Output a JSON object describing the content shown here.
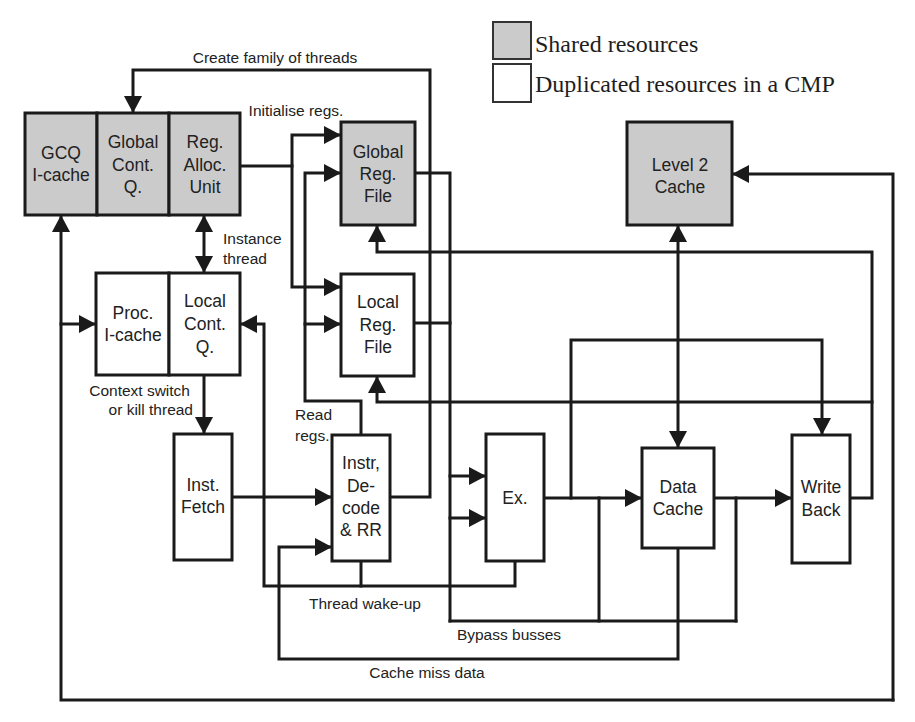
{
  "colors": {
    "shared_fill": "#cbcbcb",
    "duplicated_fill": "#ffffff",
    "stroke": "#1a1a1a"
  },
  "legend": {
    "shared": "Shared resources",
    "duplicated": "Duplicated resources in a CMP"
  },
  "blocks": {
    "gcq_icache": {
      "shared": true,
      "lines": [
        "GCQ",
        "I-cache"
      ]
    },
    "global_cont_q": {
      "shared": true,
      "lines": [
        "Global",
        "Cont.",
        "Q."
      ]
    },
    "reg_alloc_unit": {
      "shared": true,
      "lines": [
        "Reg.",
        "Alloc.",
        "Unit"
      ]
    },
    "global_reg_file": {
      "shared": true,
      "lines": [
        "Global",
        "Reg.",
        "File"
      ]
    },
    "level2_cache": {
      "shared": true,
      "lines": [
        "Level 2",
        "Cache"
      ]
    },
    "proc_icache": {
      "shared": false,
      "lines": [
        "Proc.",
        "I-cache"
      ]
    },
    "local_cont_q": {
      "shared": false,
      "lines": [
        "Local",
        "Cont.",
        "Q."
      ]
    },
    "local_reg_file": {
      "shared": false,
      "lines": [
        "Local",
        "Reg.",
        "File"
      ]
    },
    "inst_fetch": {
      "shared": false,
      "lines": [
        "Inst.",
        "Fetch"
      ]
    },
    "instr_decode": {
      "shared": false,
      "lines": [
        "Instr,",
        "De-",
        "code",
        "& RR"
      ]
    },
    "execute": {
      "shared": false,
      "lines": [
        "Ex."
      ]
    },
    "data_cache": {
      "shared": false,
      "lines": [
        "Data",
        "Cache"
      ]
    },
    "write_back": {
      "shared": false,
      "lines": [
        "Write",
        "Back"
      ]
    }
  },
  "connections": {
    "create_family": "Create family of threads",
    "initialise_regs": "Initialise regs.",
    "instance_thread": [
      "Instance",
      "thread"
    ],
    "context_switch": [
      "Context switch",
      "or kill thread"
    ],
    "read_regs": [
      "Read",
      "regs."
    ],
    "thread_wakeup": "Thread wake-up",
    "bypass_busses": "Bypass busses",
    "cache_miss_data": "Cache miss data"
  }
}
